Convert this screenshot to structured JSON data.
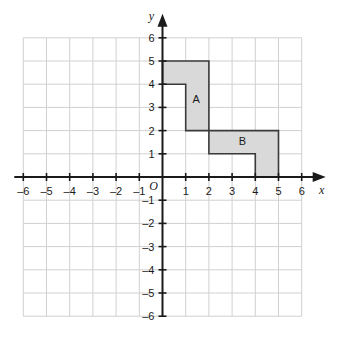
{
  "chart_data": {
    "type": "scatter",
    "title": "",
    "subtitle": "",
    "xlabel": "x",
    "ylabel": "y",
    "xlim": [
      -6,
      6
    ],
    "ylim": [
      -6,
      6
    ],
    "grid": true,
    "grid_step": 1,
    "legend": "none",
    "origin_label": "O",
    "x_ticks": [
      "-6",
      "-5",
      "-4",
      "-3",
      "-2",
      "-1",
      "1",
      "2",
      "3",
      "4",
      "5",
      "6"
    ],
    "x_tick_values": [
      -6,
      -5,
      -4,
      -3,
      -2,
      -1,
      1,
      2,
      3,
      4,
      5,
      6
    ],
    "y_ticks": [
      "6",
      "5",
      "4",
      "3",
      "2",
      "1",
      "-1",
      "-2",
      "-3",
      "-4",
      "-5",
      "-6"
    ],
    "y_tick_values": [
      6,
      5,
      4,
      3,
      2,
      1,
      -1,
      -2,
      -3,
      -4,
      -5,
      -6
    ],
    "shapes": [
      {
        "name": "A",
        "label": "A",
        "label_position": [
          1.45,
          3.35
        ],
        "vertices": [
          [
            0,
            5
          ],
          [
            2,
            5
          ],
          [
            2,
            2
          ],
          [
            1,
            2
          ],
          [
            1,
            4
          ],
          [
            0,
            4
          ]
        ],
        "fill": "#d9d9d9",
        "stroke": "#3a3a3a"
      },
      {
        "name": "B",
        "label": "B",
        "label_position": [
          3.45,
          1.55
        ],
        "vertices": [
          [
            2,
            2
          ],
          [
            5,
            2
          ],
          [
            5,
            0
          ],
          [
            4,
            0
          ],
          [
            4,
            1
          ],
          [
            2,
            1
          ]
        ],
        "fill": "#d9d9d9",
        "stroke": "#3a3a3a"
      }
    ],
    "colors": {
      "grid_line": "#d0d0d0",
      "axis_line": "#1a1a1a",
      "shape_fill": "#d9d9d9",
      "shape_stroke": "#3a3a3a",
      "background": "#ffffff"
    }
  }
}
